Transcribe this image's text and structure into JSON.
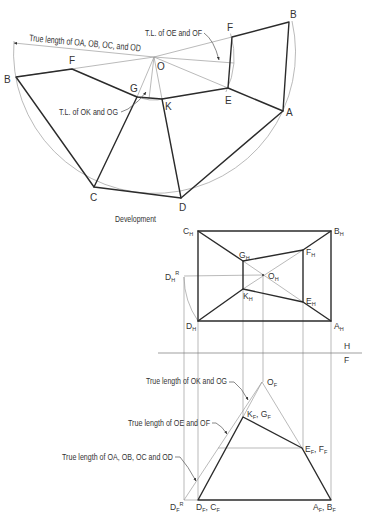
{
  "development": {
    "title": "Development",
    "annotations": {
      "true_length_oa_ob_oc_od": "True length of OA, OB, OC, and OD",
      "tl_oe_of": "T.L. of OE and OF",
      "tl_ok_og": "T.L. of OK and OG"
    },
    "points": {
      "O": "O",
      "A": "A",
      "B_left": "B",
      "B_right": "B",
      "C": "C",
      "D": "D",
      "E": "E",
      "F_left": "F",
      "F_right": "F",
      "G": "G",
      "K": "K"
    }
  },
  "top_view": {
    "points": {
      "A": {
        "base": "A",
        "sub": "H"
      },
      "B": {
        "base": "B",
        "sub": "H"
      },
      "C": {
        "base": "C",
        "sub": "H"
      },
      "D": {
        "base": "D",
        "sub": "H"
      },
      "D_R": {
        "base": "D",
        "sub": "H",
        "sup": "R"
      },
      "E": {
        "base": "E",
        "sub": "H"
      },
      "F": {
        "base": "F",
        "sub": "H"
      },
      "G": {
        "base": "G",
        "sub": "H"
      },
      "K": {
        "base": "K",
        "sub": "H"
      },
      "O": {
        "base": "O",
        "sub": "H"
      }
    }
  },
  "fold_line": {
    "upper_label": "H",
    "lower_label": "F"
  },
  "front_view": {
    "annotations": {
      "true_length_ok_og": "True length of OK and OG",
      "true_length_oe_of": "True length of OE and OF",
      "true_length_oa_ob_oc_od": "True length of OA, OB, OC and OD"
    },
    "points": {
      "O": {
        "base": "O",
        "sub": "F"
      },
      "K_G": {
        "base1": "K",
        "sub1": "F",
        "sep": ", ",
        "base2": "G",
        "sub2": "F"
      },
      "E_F": {
        "base1": "E",
        "sub1": "F",
        "sep": ", ",
        "base2": "F",
        "sub2": "F"
      },
      "D_C": {
        "base1": "D",
        "sub1": "F",
        "sep": ", ",
        "base2": "C",
        "sub2": "F"
      },
      "A_B": {
        "base1": "A",
        "sub1": "F",
        "sep": ", ",
        "base2": "B",
        "sub2": "F"
      },
      "D_R": {
        "base": "D",
        "sub": "F",
        "sup": "R"
      }
    }
  },
  "colors": {
    "object_line": "#2b2b2b",
    "construction_line": "#9c9c9c",
    "text": "#333333",
    "background": "#ffffff"
  }
}
